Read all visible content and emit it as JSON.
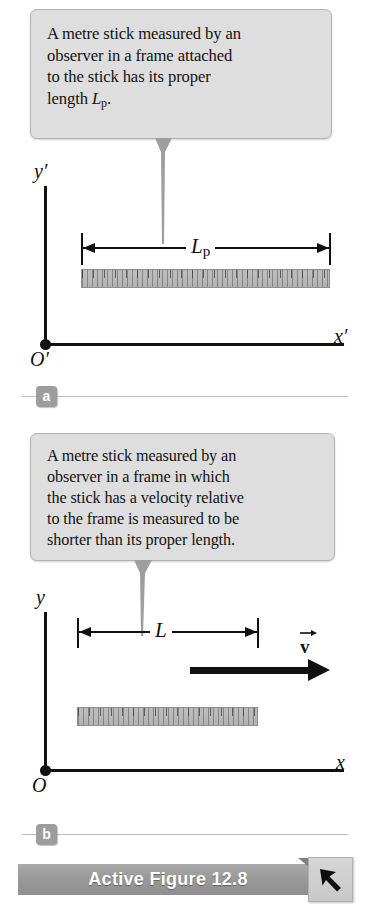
{
  "figure": {
    "panels": [
      {
        "id": "a",
        "badge_label": "a",
        "caption_line1": "A metre stick measured by an",
        "caption_line2": "observer in a frame attached",
        "caption_line3": "to the stick has its proper",
        "caption_line4_pre": "length ",
        "caption_line4_var": "L",
        "caption_line4_sub": "p",
        "caption_line4_post": ".",
        "y_axis_label": "y′",
        "x_axis_label": "x′",
        "origin_label": "O′",
        "dimension_label": "L",
        "dimension_sub": "p"
      },
      {
        "id": "b",
        "badge_label": "b",
        "caption_line1": "A metre stick measured by an",
        "caption_line2": "observer in a frame in which",
        "caption_line3": "the stick has a velocity relative",
        "caption_line4": "to the frame is measured to be",
        "caption_line5": "shorter than its proper length.",
        "y_axis_label": "y",
        "x_axis_label": "x",
        "origin_label": "O",
        "dimension_label": "L",
        "velocity_label": "v"
      }
    ],
    "banner": {
      "title": "Active Figure 12.8",
      "button_icon": "cursor-arrow-icon"
    },
    "colors": {
      "callout_fill": "#dedede",
      "callout_border": "#b4b4b4",
      "axis": "#111111",
      "stick_fill": "#b9b9b9",
      "badge_fill": "#9d9d9d",
      "banner_fill": "#9a9a9a",
      "banner_text": "#ffffff"
    }
  }
}
